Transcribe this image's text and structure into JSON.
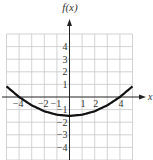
{
  "chart_data": {
    "type": "line",
    "title": "",
    "xlabel": "x",
    "ylabel": "f(x)",
    "xlim": [
      -5,
      5
    ],
    "ylim": [
      -5,
      5
    ],
    "grid": true,
    "x_tick_labels": [
      "-4",
      "-2",
      "-1",
      "1",
      "2",
      "4"
    ],
    "x_ticks": [
      -4,
      -2,
      -1,
      1,
      2,
      4
    ],
    "y_tick_labels": [
      "4",
      "3",
      "2",
      "1",
      "-1",
      "-2",
      "-3",
      "-4"
    ],
    "y_ticks": [
      4,
      3,
      2,
      1,
      -1,
      -2,
      -3,
      -4
    ],
    "series": [
      {
        "name": "f(x)",
        "x": [
          -5,
          -4,
          -3,
          -2,
          -1,
          0,
          1,
          2,
          3,
          4,
          5
        ],
        "values": [
          0.84,
          0,
          -0.66,
          -1.13,
          -1.41,
          -1.5,
          -1.41,
          -1.13,
          -0.66,
          0,
          0.84
        ]
      }
    ],
    "annotations": [
      "x-intercepts at -4 and 4",
      "minimum at (0, -1.5)"
    ]
  },
  "axis_labels": {
    "y": "f(x)",
    "x": "x"
  },
  "colors": {
    "grid": "#c8c8c8",
    "axis": "#222222",
    "curve": "#111111"
  }
}
